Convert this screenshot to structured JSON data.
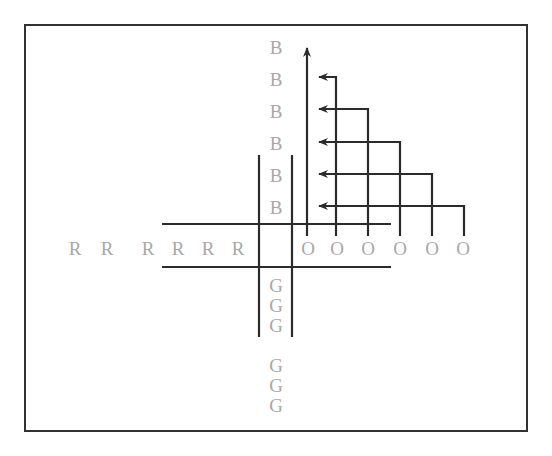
{
  "diagram": {
    "colors": {
      "line": "#2b2b2b",
      "label": "#a8a8a8",
      "frame": "#333333",
      "background": "#ffffff"
    },
    "labels": {
      "north": [
        "B",
        "B",
        "B",
        "B",
        "B",
        "B"
      ],
      "west": [
        "R",
        "R",
        "R",
        "R",
        "R",
        "R"
      ],
      "east": [
        "O",
        "O",
        "O",
        "O",
        "O",
        "O"
      ],
      "south_upper": [
        "G",
        "G",
        "G"
      ],
      "south_lower": [
        "G",
        "G",
        "G"
      ]
    }
  }
}
